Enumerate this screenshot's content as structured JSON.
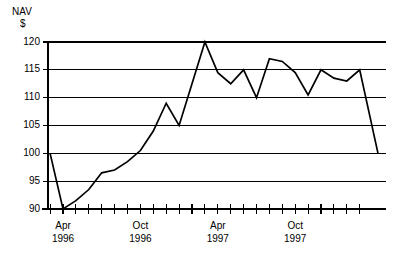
{
  "chart_data": {
    "type": "line",
    "title": "",
    "ylabel": "NAV $",
    "ylabel_lines": [
      "NAV",
      "$"
    ],
    "xlabel": "",
    "ylim": [
      90,
      120
    ],
    "yticks": [
      90,
      95,
      100,
      105,
      110,
      115,
      120
    ],
    "ytick_labels": [
      "90",
      "95",
      "100",
      "105",
      "110",
      "115",
      "120"
    ],
    "grid": true,
    "legend": "none",
    "x_tick_count": 25,
    "x_labeled_ticks": [
      {
        "index": 1,
        "line1": "Apr",
        "line2": "1996"
      },
      {
        "index": 7,
        "line1": "Oct",
        "line2": "1996"
      },
      {
        "index": 13,
        "line1": "Apr",
        "line2": "1997"
      },
      {
        "index": 19,
        "line1": "Oct",
        "line2": "1997"
      }
    ],
    "x": [
      "Mar 1996",
      "Apr 1996",
      "May 1996",
      "Jun 1996",
      "Jul 1996",
      "Aug 1996",
      "Sep 1996",
      "Oct 1996",
      "Nov 1996",
      "Dec 1996",
      "Jan 1997",
      "Feb 1997",
      "Mar 1997",
      "Apr 1997",
      "May 1997",
      "Jun 1997",
      "Jul 1997",
      "Aug 1997",
      "Sep 1997",
      "Oct 1997",
      "Nov 1997",
      "Dec 1997",
      "Jan 1998",
      "Feb 1998",
      "Mar 1998"
    ],
    "values": [
      100.0,
      90.0,
      91.5,
      93.5,
      96.5,
      97.0,
      98.5,
      100.5,
      104.0,
      109.0,
      105.0,
      112.5,
      120.0,
      114.5,
      112.5,
      115.0,
      110.0,
      117.0,
      116.5,
      114.5,
      110.5,
      115.0,
      113.5,
      113.0,
      115.0
    ],
    "final_drop_value": 100.0,
    "series_color": "#000000",
    "background_color": "#ffffff"
  },
  "axis_meta": {
    "y_axis_caption_line1": "NAV",
    "y_axis_caption_line2": "$"
  }
}
